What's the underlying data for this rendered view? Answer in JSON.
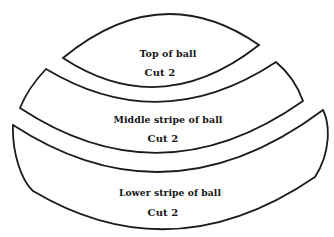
{
  "diagram": {
    "type": "sewing-pattern-pieces",
    "subject": "ball",
    "background_color": "#ffffff",
    "line_color": "#1b1b1b",
    "pieces": [
      {
        "id": "top-of-ball",
        "label": "Top of ball",
        "cut_instruction": "Cut 2"
      },
      {
        "id": "middle-stripe-of-ball",
        "label": "Middle stripe of ball",
        "cut_instruction": "Cut 2"
      },
      {
        "id": "lower-stripe-of-ball",
        "label": "Lower stripe of ball",
        "cut_instruction": "Cut 2"
      }
    ]
  }
}
